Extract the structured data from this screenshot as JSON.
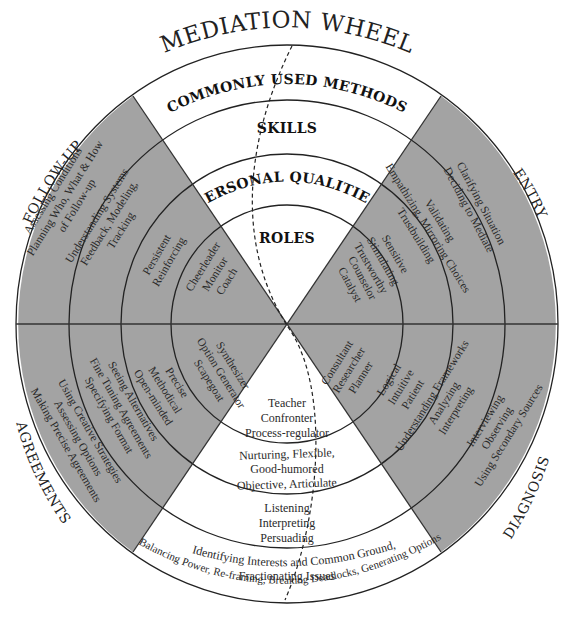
{
  "title": "MEDIATION WHEEL",
  "layers": {
    "methods": "COMMONLY USED METHODS",
    "skills": "SKILLS",
    "qualities": "PERSONAL QUALITIES",
    "roles": "ROLES"
  },
  "stages": {
    "entry": "ENTRY",
    "diagnosis": "DIAGNOSIS",
    "agreements": "AGREEMENTS",
    "follow_up": "FOLLOW-UP"
  },
  "entry": {
    "methods": [
      "Clarifying Situation",
      "Deciding to Mediate"
    ],
    "skills": [
      "Validating",
      "Empathizing, Mirroring Choices",
      "Trustbuilding"
    ],
    "qualities": [
      "Sensitive",
      "Stimulating",
      "Trustworthy"
    ],
    "roles": [
      "Counselor",
      "Catalyst"
    ]
  },
  "diagnosis": {
    "roles": [
      "Consultant",
      "Researcher",
      "Planner"
    ],
    "qualities": [
      "Logical",
      "Intuitive",
      "Patient"
    ],
    "skills": [
      "Understanding Frameworks",
      "Analyzing",
      "Interpreting"
    ],
    "methods": [
      "Interviewing",
      "Observing",
      "Using Secondary Sources"
    ]
  },
  "agreements": {
    "roles": [
      "Synthesizer",
      "Option Generator",
      "Scapegoat"
    ],
    "qualities": [
      "Precise",
      "Methodical",
      "Open-minded"
    ],
    "skills": [
      "Seeing Alternatives",
      "Fine Tuning Agreements",
      "Specifying Format"
    ],
    "methods": [
      "Using Creative Strategies",
      "Assessing Options",
      "Making Precise Agreements"
    ]
  },
  "follow_up": {
    "roles": [
      "Cheerleader",
      "Monitor",
      "Coach"
    ],
    "qualities": [
      "Persistent",
      "Reinforcing"
    ],
    "skills": [
      "Understanding Systems",
      "Feedback, Modeling,",
      "Tracking"
    ],
    "methods": [
      "Assessing Conditions",
      "Planning Who, What & How",
      "of Follow-up"
    ]
  },
  "negotiation": {
    "roles": [
      "Teacher",
      "Confronter",
      "Process-regulator"
    ],
    "qualities": [
      "Nurturing, Flexible,",
      "Good-humored",
      "Objective, Articulate"
    ],
    "skills": [
      "Listening",
      "Interpreting",
      "Persuading"
    ],
    "methods": [
      "Identifying Interests and Common Ground,",
      "Fractionating Issues",
      "Balancing Power, Re-framing, Breaking Deadlocks, Generating Options"
    ]
  },
  "colors": {
    "grey_sector": "#a3a3a3",
    "white_sector": "#ffffff",
    "line": "#222222"
  }
}
